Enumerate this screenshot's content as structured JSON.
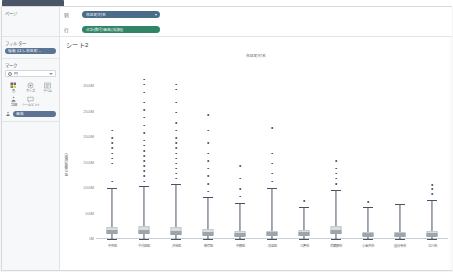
{
  "window": {
    "tab_label": ""
  },
  "sidebar": {
    "pages": {
      "title": "ページ"
    },
    "filters": {
      "title": "フィルター",
      "pills": [
        {
          "label": "種類 (はし市区町...",
          "color": "#5b7493"
        }
      ]
    },
    "marks": {
      "title": "マーク",
      "mark_type": "円",
      "buttons": [
        {
          "label": "色",
          "icon": "color-icon"
        },
        {
          "label": "サイズ",
          "icon": "size-icon"
        },
        {
          "label": "ラベル",
          "icon": "label-icon"
        },
        {
          "label": "詳細",
          "icon": "detail-icon"
        },
        {
          "label": "ツールヒント",
          "icon": "tooltip-icon"
        }
      ],
      "detail_pill": {
        "label": "価格",
        "color": "#5b7493"
      }
    }
  },
  "shelves": {
    "columns": {
      "label": "列",
      "pill": "市区町村名",
      "color": "#4a6b8a"
    },
    "rows": {
      "label": "行",
      "pill": "合計(取引価格(総額))",
      "color": "#2f8566"
    }
  },
  "sheet": {
    "title": "シート2",
    "column_caption": "市区町村名"
  },
  "chart_data": {
    "type": "boxplot",
    "title": "シート2",
    "xlabel": "市区町村名",
    "ylabel": "取引価格(総額)",
    "ylim": [
      0,
      3500000000
    ],
    "yticks": [
      0,
      500000000,
      1000000000,
      1500000000,
      2000000000,
      2500000000,
      3000000000
    ],
    "ytick_labels": [
      "0M",
      "500M",
      "1000M",
      "1500M",
      "2000M",
      "2500M",
      "3000M"
    ],
    "grid": false,
    "legend": "none",
    "categories": [
      "中央区",
      "千代田区",
      "渋谷区",
      "新宿区",
      "中野区",
      "杉並区",
      "三鷹市",
      "武蔵野市",
      "小金井市",
      "国分寺市",
      "立川市"
    ],
    "boxes": [
      {
        "category": "中央区",
        "min": 5000000,
        "q1": 95000000,
        "median": 140000000,
        "q3": 235000000,
        "max": 1000000000,
        "outliers": [
          1150000000,
          1500000000,
          1600000000,
          1700000000,
          1800000000,
          1900000000,
          2000000000,
          2150000000
        ]
      },
      {
        "category": "千代田区",
        "min": 5000000,
        "q1": 90000000,
        "median": 130000000,
        "q3": 250000000,
        "max": 1050000000,
        "outliers": [
          1150000000,
          1250000000,
          1350000000,
          1450000000,
          1550000000,
          1650000000,
          1750000000,
          1850000000,
          1950000000,
          2100000000,
          2250000000,
          2400000000,
          2550000000,
          2700000000,
          2900000000,
          3050000000,
          3150000000
        ]
      },
      {
        "category": "渋谷区",
        "min": 5000000,
        "q1": 85000000,
        "median": 125000000,
        "q3": 240000000,
        "max": 1080000000,
        "outliers": [
          1200000000,
          1300000000,
          1400000000,
          1500000000,
          1600000000,
          1700000000,
          1800000000,
          1900000000,
          2000000000,
          2150000000,
          2300000000,
          2500000000,
          2700000000,
          2950000000,
          3050000000
        ]
      },
      {
        "category": "新宿区",
        "min": 5000000,
        "q1": 70000000,
        "median": 105000000,
        "q3": 190000000,
        "max": 820000000,
        "outliers": [
          950000000,
          1100000000,
          1250000000,
          1400000000,
          1550000000,
          1700000000,
          1900000000,
          2150000000,
          2450000000
        ]
      },
      {
        "category": "中野区",
        "min": 5000000,
        "q1": 55000000,
        "median": 85000000,
        "q3": 155000000,
        "max": 700000000,
        "outliers": [
          850000000,
          1000000000,
          1200000000,
          1450000000
        ]
      },
      {
        "category": "杉並区",
        "min": 5000000,
        "q1": 60000000,
        "median": 90000000,
        "q3": 165000000,
        "max": 1000000000,
        "outliers": [
          1150000000,
          1300000000,
          1500000000,
          1700000000,
          2200000000
        ]
      },
      {
        "category": "三鷹市",
        "min": 5000000,
        "q1": 65000000,
        "median": 100000000,
        "q3": 180000000,
        "max": 620000000,
        "outliers": [
          760000000
        ]
      },
      {
        "category": "武蔵野市",
        "min": 5000000,
        "q1": 90000000,
        "median": 135000000,
        "q3": 255000000,
        "max": 960000000,
        "outliers": [
          1100000000,
          1200000000,
          1300000000,
          1400000000,
          1550000000
        ]
      },
      {
        "category": "小金井市",
        "min": 5000000,
        "q1": 50000000,
        "median": 80000000,
        "q3": 145000000,
        "max": 620000000,
        "outliers": [
          740000000
        ]
      },
      {
        "category": "国分寺市",
        "min": 5000000,
        "q1": 48000000,
        "median": 75000000,
        "q3": 140000000,
        "max": 680000000,
        "outliers": []
      },
      {
        "category": "立川市",
        "min": 5000000,
        "q1": 52000000,
        "median": 82000000,
        "q3": 150000000,
        "max": 760000000,
        "outliers": [
          900000000,
          1000000000,
          1080000000
        ]
      }
    ]
  }
}
